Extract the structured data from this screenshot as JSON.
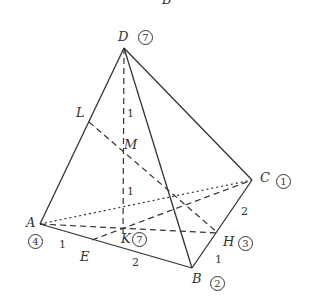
{
  "figure": {
    "top_cut_label": "B",
    "points": {
      "D": {
        "label": "D",
        "badge": "7"
      },
      "A": {
        "label": "A",
        "badge": "4"
      },
      "B": {
        "label": "B",
        "badge": "2"
      },
      "C": {
        "label": "C",
        "badge": "1"
      },
      "H": {
        "label": "H",
        "badge": "3"
      },
      "K": {
        "label": "K",
        "badge": "7"
      },
      "M": {
        "label": "M"
      },
      "L": {
        "label": "L"
      },
      "E": {
        "label": "E"
      }
    },
    "lengths": {
      "DM": "1",
      "MK": "1",
      "AE": "1",
      "EB": "2",
      "BH": "1",
      "HC": "2"
    }
  }
}
